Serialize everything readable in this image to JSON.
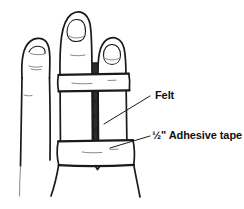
{
  "figure": {
    "type": "line-drawing",
    "background_color": "#ffffff",
    "ink_color": "#1a1a1a",
    "felt_color": "#2b2b2b"
  },
  "labels": {
    "felt": {
      "text": "Felt",
      "name": "felt-label",
      "leader_from": "150,96",
      "leader_to": "104,124"
    },
    "adhesive_tape": {
      "text": "½\" Adhesive tape",
      "name": "adhesive-tape-label",
      "leader_from": "150,136",
      "leader_to": "110,148"
    }
  },
  "parts": {
    "index_finger": "index-finger",
    "middle_finger": "middle-finger",
    "ring_finger": "ring-finger",
    "upper_tape_band": "upper-tape-band",
    "lower_tape_band": "lower-tape-band",
    "felt_strip": "felt-strip",
    "hand_outline": "hand-outline"
  }
}
